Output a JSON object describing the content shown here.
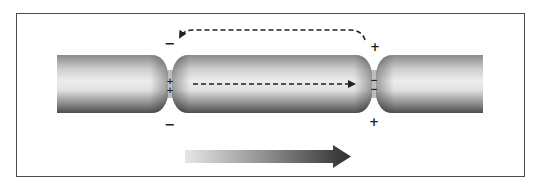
{
  "diagram": {
    "frame": {
      "x": 16,
      "y": 13,
      "width": 509,
      "height": 164
    },
    "axon": {
      "x_start": 57,
      "x_end": 483,
      "y_top": 55,
      "y_bottom": 113,
      "segments": [
        {
          "id": "internode-left",
          "x_start": 57,
          "x_end": 170
        },
        {
          "id": "internode-middle",
          "x_start": 170,
          "x_end": 374
        },
        {
          "id": "internode-right",
          "x_start": 374,
          "x_end": 483
        }
      ],
      "nodes": [
        {
          "id": "node-1",
          "x": 170,
          "outside_top": "−",
          "outside_bottom": "−",
          "inside": [
            "+",
            "+"
          ]
        },
        {
          "id": "node-2",
          "x": 374,
          "outside_top": "+",
          "outside_bottom": "+",
          "inside": [
            "−",
            "−"
          ]
        }
      ]
    },
    "current_arrows": {
      "internal": {
        "style": "dashed",
        "from": [
          193,
          84
        ],
        "to": [
          356,
          84
        ],
        "direction": "right"
      },
      "external": {
        "style": "dashed",
        "from": [
          365,
          40
        ],
        "to": [
          178,
          38
        ],
        "direction": "left-looping-over-top"
      }
    },
    "propagation_arrow": {
      "x_start": 185,
      "x_end": 351,
      "y": 156,
      "direction": "right",
      "gradient_from": "#e6e6e6",
      "gradient_to": "#333333"
    },
    "colors": {
      "frame": "#4a4a4a",
      "axon_dark": "#5a5a5a",
      "axon_light": "#e8e8e8",
      "signs": "#222222"
    }
  },
  "labels": {
    "node1_top": "−",
    "node1_bottom": "−",
    "node1_in1": "+",
    "node1_in2": "+",
    "node2_top": "+",
    "node2_bottom": "+",
    "node2_in1": "−",
    "node2_in2": "−"
  }
}
